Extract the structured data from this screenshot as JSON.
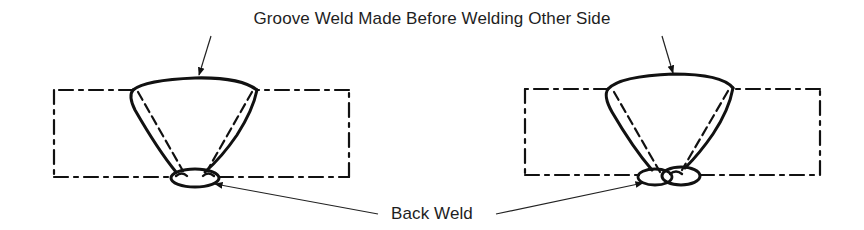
{
  "diagram": {
    "top_label": "Groove Weld Made Before Welding Other Side",
    "bottom_label": "Back Weld",
    "figures": [
      {
        "name": "left-joint",
        "description": "Groove weld with back weld (single pass)"
      },
      {
        "name": "right-joint",
        "description": "Groove weld with back weld (two passes)"
      }
    ],
    "colors": {
      "line": "#111111",
      "text": "#1e1e1e",
      "background": "#ffffff"
    }
  }
}
